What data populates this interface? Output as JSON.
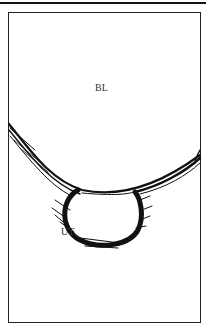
{
  "diagram": {
    "labels": {
      "bladder": "BL",
      "urethra": "UT"
    },
    "colors": {
      "ink": "#111111",
      "background": "#ffffff"
    }
  }
}
